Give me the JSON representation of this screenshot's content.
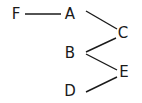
{
  "diagram": {
    "type": "tree",
    "nodes": [
      {
        "id": "F",
        "label": "F",
        "x": 16,
        "y": 14
      },
      {
        "id": "A",
        "label": "A",
        "x": 70,
        "y": 14
      },
      {
        "id": "C",
        "label": "C",
        "x": 123,
        "y": 33
      },
      {
        "id": "B",
        "label": "B",
        "x": 70,
        "y": 52
      },
      {
        "id": "E",
        "label": "E",
        "x": 124,
        "y": 71
      },
      {
        "id": "D",
        "label": "D",
        "x": 70,
        "y": 90
      }
    ],
    "edges": [
      {
        "from": "F",
        "to": "A"
      },
      {
        "from": "A",
        "to": "C"
      },
      {
        "from": "C",
        "to": "B"
      },
      {
        "from": "B",
        "to": "E"
      },
      {
        "from": "E",
        "to": "D"
      }
    ]
  }
}
